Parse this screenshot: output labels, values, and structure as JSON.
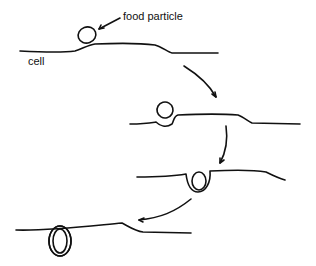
{
  "diagram": {
    "labels": {
      "food_particle": "food particle",
      "cell": "cell"
    },
    "stages": [
      {
        "id": 1,
        "description": "food particle resting on cell membrane"
      },
      {
        "id": 2,
        "description": "membrane begins to fold around particle"
      },
      {
        "id": 3,
        "description": "membrane engulfs particle into pocket"
      },
      {
        "id": 4,
        "description": "particle enclosed in vesicle within cell"
      }
    ],
    "colors": {
      "stroke": "#111111",
      "background": "#ffffff"
    }
  }
}
